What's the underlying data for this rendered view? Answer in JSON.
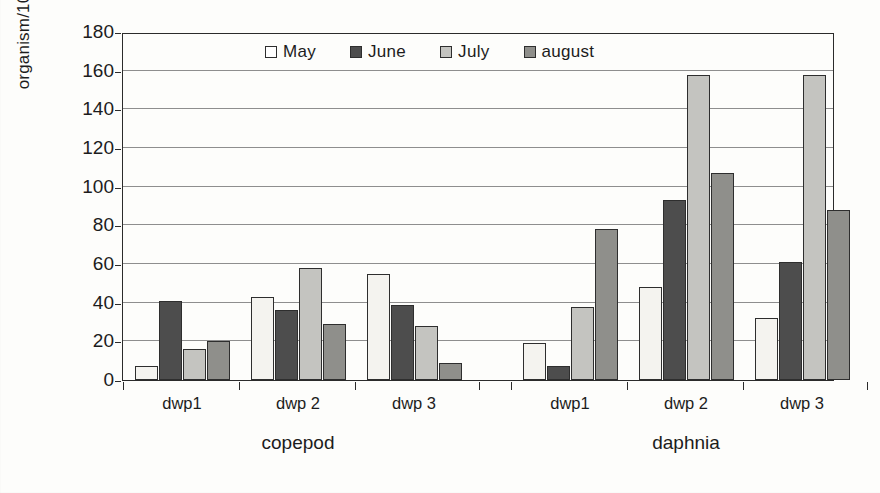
{
  "chart_data": {
    "type": "bar",
    "title": "",
    "subtitle": "",
    "xlabel": "",
    "ylabel": "organism/100 ml",
    "ylim": [
      0,
      180
    ],
    "ytick_step": 20,
    "yticks": [
      0,
      20,
      40,
      60,
      80,
      100,
      120,
      140,
      160,
      180
    ],
    "ytick_labels": [
      "0",
      "20",
      "40",
      "60",
      "80",
      "100",
      "120",
      "140",
      "160",
      "180"
    ],
    "grid": "horizontal",
    "legend_position": "top-center-inside",
    "categories": [
      "dwp1",
      "dwp 2",
      "dwp 3",
      "dwp1",
      "dwp 2",
      "dwp 3"
    ],
    "groups": [
      {
        "section": "copepod",
        "categories": [
          "dwp1",
          "dwp 2",
          "dwp 3"
        ]
      },
      {
        "section": "daphnia",
        "categories": [
          "dwp1",
          "dwp 2",
          "dwp 3"
        ]
      }
    ],
    "series": [
      {
        "name": "May",
        "color": "#f4f3ef",
        "values": [
          7,
          43,
          55,
          19,
          48,
          32
        ]
      },
      {
        "name": "June",
        "color": "#4d4d4d",
        "values": [
          41,
          36,
          39,
          7,
          93,
          61
        ]
      },
      {
        "name": "July",
        "color": "#c4c4c0",
        "values": [
          16,
          58,
          28,
          38,
          158,
          158
        ]
      },
      {
        "name": "august",
        "color": "#8f8f8b",
        "values": [
          20,
          29,
          9,
          78,
          107,
          88
        ]
      }
    ],
    "section_labels": [
      "copepod",
      "daphnia"
    ],
    "annotations": []
  },
  "legend": {
    "entries": [
      {
        "label": "May",
        "swatch": "may"
      },
      {
        "label": "June",
        "swatch": "june"
      },
      {
        "label": "July",
        "swatch": "july"
      },
      {
        "label": "august",
        "swatch": "august"
      }
    ]
  },
  "axis": {
    "y_title": "organism/100 ml"
  }
}
